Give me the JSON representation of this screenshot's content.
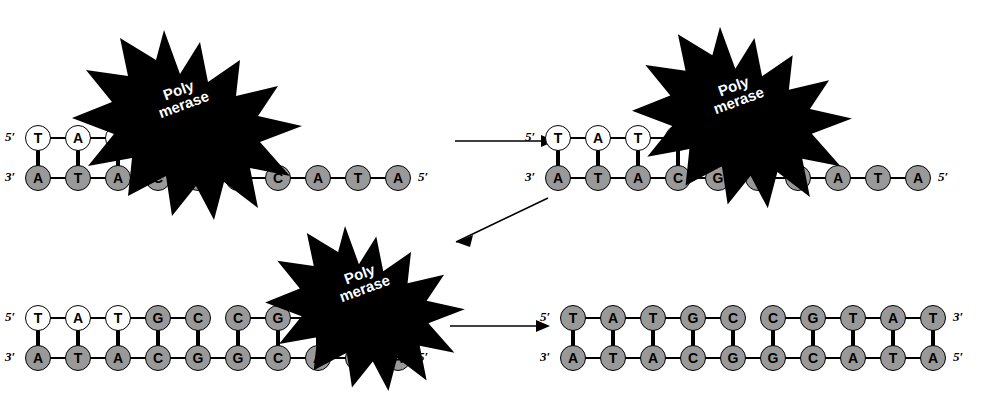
{
  "figure": {
    "enzyme_label": "Poly\nmerase",
    "colors": {
      "template_base_fill": "#999999",
      "new_base_fill": "#ffffff",
      "outline": "#000000",
      "background": "#ffffff",
      "burst_fill": "#000000",
      "burst_text": "#ffffff"
    },
    "labels": {
      "five_prime": "5′",
      "three_prime": "3′"
    }
  },
  "panels": [
    {
      "id": "panel-1",
      "name": "initial-primer-template",
      "top_strand": {
        "name": "new-strand",
        "left_label": "5′",
        "right_label": "3′",
        "bases": [
          {
            "base": "T",
            "fill": "white"
          },
          {
            "base": "A",
            "fill": "white"
          },
          {
            "base": "T",
            "fill": "white"
          }
        ]
      },
      "bottom_strand": {
        "name": "template-strand",
        "left_label": "3′",
        "right_label": "5′",
        "bases": [
          {
            "base": "A",
            "fill": "gray"
          },
          {
            "base": "T",
            "fill": "gray"
          },
          {
            "base": "A",
            "fill": "gray"
          },
          {
            "base": "C",
            "fill": "gray"
          },
          {
            "base": "G",
            "fill": "gray"
          },
          {
            "base": "G",
            "fill": "gray"
          },
          {
            "base": "C",
            "fill": "gray"
          },
          {
            "base": "A",
            "fill": "gray"
          },
          {
            "base": "T",
            "fill": "gray"
          },
          {
            "base": "A",
            "fill": "gray"
          }
        ]
      },
      "polymerase": {
        "label": "Poly\nmerase",
        "present": true
      }
    },
    {
      "id": "panel-2",
      "name": "one-base-added",
      "top_strand": {
        "name": "new-strand",
        "left_label": "5′",
        "right_label": "3′",
        "bases": [
          {
            "base": "T",
            "fill": "white"
          },
          {
            "base": "A",
            "fill": "white"
          },
          {
            "base": "T",
            "fill": "white"
          },
          {
            "base": "G",
            "fill": "white"
          }
        ]
      },
      "bottom_strand": {
        "name": "template-strand",
        "left_label": "3′",
        "right_label": "5′",
        "bases": [
          {
            "base": "A",
            "fill": "gray"
          },
          {
            "base": "T",
            "fill": "gray"
          },
          {
            "base": "A",
            "fill": "gray"
          },
          {
            "base": "C",
            "fill": "gray"
          },
          {
            "base": "G",
            "fill": "gray"
          },
          {
            "base": "G",
            "fill": "gray"
          },
          {
            "base": "C",
            "fill": "gray"
          },
          {
            "base": "A",
            "fill": "gray"
          },
          {
            "base": "T",
            "fill": "gray"
          },
          {
            "base": "A",
            "fill": "gray"
          }
        ]
      },
      "polymerase": {
        "label": "Poly\nmerase",
        "present": true
      }
    },
    {
      "id": "panel-3",
      "name": "extension-in-progress",
      "top_strand": {
        "name": "new-strand",
        "left_label": "5′",
        "right_label": "3′",
        "bases": [
          {
            "base": "T",
            "fill": "white"
          },
          {
            "base": "A",
            "fill": "white"
          },
          {
            "base": "T",
            "fill": "white"
          },
          {
            "base": "G",
            "fill": "gray"
          },
          {
            "base": "C",
            "fill": "gray"
          },
          {
            "base": "C",
            "fill": "gray"
          },
          {
            "base": "G",
            "fill": "gray"
          },
          {
            "base": "T",
            "fill": "gray"
          }
        ]
      },
      "bottom_strand": {
        "name": "template-strand",
        "left_label": "3′",
        "right_label": "5′",
        "bases": [
          {
            "base": "A",
            "fill": "gray"
          },
          {
            "base": "T",
            "fill": "gray"
          },
          {
            "base": "A",
            "fill": "gray"
          },
          {
            "base": "C",
            "fill": "gray"
          },
          {
            "base": "G",
            "fill": "gray"
          },
          {
            "base": "G",
            "fill": "gray"
          },
          {
            "base": "C",
            "fill": "gray"
          },
          {
            "base": "A",
            "fill": "gray"
          },
          {
            "base": "T",
            "fill": "gray"
          },
          {
            "base": "A",
            "fill": "gray"
          }
        ]
      },
      "polymerase": {
        "label": "Poly\nmerase",
        "present": true
      }
    },
    {
      "id": "panel-4",
      "name": "completed-duplex",
      "top_strand": {
        "name": "new-strand",
        "left_label": "5′",
        "right_label": "3′",
        "bases": [
          {
            "base": "T",
            "fill": "gray"
          },
          {
            "base": "A",
            "fill": "gray"
          },
          {
            "base": "T",
            "fill": "gray"
          },
          {
            "base": "G",
            "fill": "gray"
          },
          {
            "base": "C",
            "fill": "gray"
          },
          {
            "base": "C",
            "fill": "gray"
          },
          {
            "base": "G",
            "fill": "gray"
          },
          {
            "base": "T",
            "fill": "gray"
          },
          {
            "base": "A",
            "fill": "gray"
          },
          {
            "base": "T",
            "fill": "gray"
          }
        ]
      },
      "bottom_strand": {
        "name": "template-strand",
        "left_label": "3′",
        "right_label": "5′",
        "bases": [
          {
            "base": "A",
            "fill": "gray"
          },
          {
            "base": "T",
            "fill": "gray"
          },
          {
            "base": "A",
            "fill": "gray"
          },
          {
            "base": "C",
            "fill": "gray"
          },
          {
            "base": "G",
            "fill": "gray"
          },
          {
            "base": "G",
            "fill": "gray"
          },
          {
            "base": "C",
            "fill": "gray"
          },
          {
            "base": "A",
            "fill": "gray"
          },
          {
            "base": "T",
            "fill": "gray"
          },
          {
            "base": "A",
            "fill": "gray"
          }
        ]
      },
      "polymerase": {
        "label": "Poly\nmerase",
        "present": false
      }
    }
  ],
  "arrows": [
    {
      "name": "arrow-panel1-to-panel2",
      "direction": "right"
    },
    {
      "name": "arrow-panel2-to-panel3",
      "direction": "down-left"
    },
    {
      "name": "arrow-panel3-to-panel4",
      "direction": "right"
    }
  ]
}
